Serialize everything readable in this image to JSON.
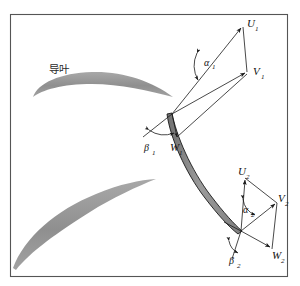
{
  "figure": {
    "frame": {
      "border_color": "#555555",
      "background": "#ffffff"
    },
    "vane_label": "导叶",
    "colors": {
      "vane_fill": "#9a9a9a",
      "blade_fill": "#8c8c8c",
      "blade_stroke": "#1a1a1a",
      "vector_stroke": "#1a1a1a",
      "text": "#111111"
    },
    "labels": {
      "u1": {
        "base": "U",
        "sub": "1"
      },
      "v1": {
        "base": "V",
        "sub": "1"
      },
      "w1": {
        "base": "W",
        "sub": "1"
      },
      "alpha1": {
        "base": "α",
        "sub": "1"
      },
      "beta1": {
        "base": "β",
        "sub": "1"
      },
      "u2": {
        "base": "U",
        "sub": "2"
      },
      "v2": {
        "base": "V",
        "sub": "2"
      },
      "w2": {
        "base": "W",
        "sub": "2"
      },
      "alpha2": {
        "base": "α",
        "sub": "2"
      },
      "beta2": {
        "base": "β",
        "sub": "2"
      }
    },
    "triangles": {
      "inlet": {
        "name": "inlet-velocity-triangle",
        "origin": [
          172,
          114
        ],
        "u_tip": [
          243,
          26
        ],
        "v_tip": [
          247,
          74
        ],
        "w_tip": [
          176,
          138
        ],
        "alpha_angle_at": [
          200,
          63
        ],
        "beta_angle_at": [
          155,
          128
        ]
      },
      "outlet": {
        "name": "outlet-velocity-triangle",
        "origin": [
          241,
          231
        ],
        "u_tip": [
          245,
          178
        ],
        "v_tip": [
          277,
          203
        ],
        "w_tip": [
          272,
          249
        ],
        "alpha_angle_at": [
          251,
          207
        ],
        "beta_angle_at": [
          237,
          247
        ]
      }
    }
  }
}
